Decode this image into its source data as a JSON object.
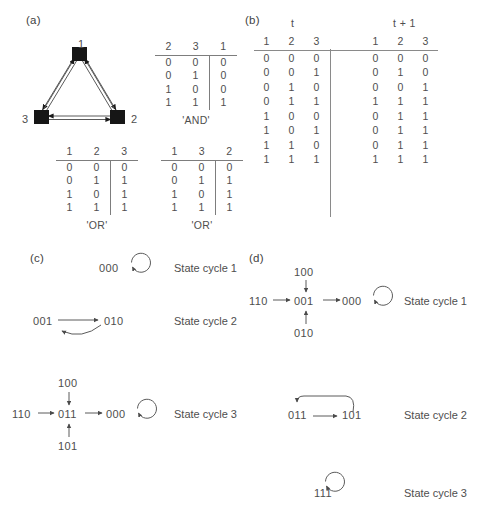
{
  "figure": {
    "panels": {
      "a": "(a)",
      "b": "(b)",
      "c": "(c)",
      "d": "(d)"
    }
  },
  "network": {
    "nodes": [
      {
        "id": "1",
        "label": "1"
      },
      {
        "id": "2",
        "label": "2"
      },
      {
        "id": "3",
        "label": "3"
      }
    ],
    "edges": [
      {
        "from": "1",
        "to": "3",
        "bidirectional": true
      },
      {
        "from": "1",
        "to": "2",
        "bidirectional": true
      },
      {
        "from": "3",
        "to": "2",
        "bidirectional": true
      }
    ]
  },
  "truth_tables": [
    {
      "id": "and-table",
      "headers": [
        "2",
        "3",
        "1"
      ],
      "rows": [
        [
          "0",
          "0",
          "0"
        ],
        [
          "0",
          "1",
          "0"
        ],
        [
          "1",
          "0",
          "0"
        ],
        [
          "1",
          "1",
          "1"
        ]
      ],
      "caption": "'AND'"
    },
    {
      "id": "or-table-1",
      "headers": [
        "1",
        "2",
        "3"
      ],
      "rows": [
        [
          "0",
          "0",
          "0"
        ],
        [
          "0",
          "1",
          "1"
        ],
        [
          "1",
          "0",
          "1"
        ],
        [
          "1",
          "1",
          "1"
        ]
      ],
      "caption": "'OR'"
    },
    {
      "id": "or-table-2",
      "headers": [
        "1",
        "3",
        "2"
      ],
      "rows": [
        [
          "0",
          "0",
          "0"
        ],
        [
          "0",
          "1",
          "1"
        ],
        [
          "1",
          "0",
          "1"
        ],
        [
          "1",
          "1",
          "1"
        ]
      ],
      "caption": "'OR'"
    }
  ],
  "transition_table": {
    "time_label_t": "t",
    "time_label_t1": "t + 1",
    "headers_t": [
      "1",
      "2",
      "3"
    ],
    "headers_t1": [
      "1",
      "2",
      "3"
    ],
    "rows": [
      {
        "t": [
          "0",
          "0",
          "0"
        ],
        "t1": [
          "0",
          "0",
          "0"
        ]
      },
      {
        "t": [
          "0",
          "0",
          "1"
        ],
        "t1": [
          "0",
          "1",
          "0"
        ]
      },
      {
        "t": [
          "0",
          "1",
          "0"
        ],
        "t1": [
          "0",
          "0",
          "1"
        ]
      },
      {
        "t": [
          "0",
          "1",
          "1"
        ],
        "t1": [
          "1",
          "1",
          "1"
        ]
      },
      {
        "t": [
          "1",
          "0",
          "0"
        ],
        "t1": [
          "0",
          "1",
          "1"
        ]
      },
      {
        "t": [
          "1",
          "0",
          "1"
        ],
        "t1": [
          "0",
          "1",
          "1"
        ]
      },
      {
        "t": [
          "1",
          "1",
          "0"
        ],
        "t1": [
          "0",
          "1",
          "1"
        ]
      },
      {
        "t": [
          "1",
          "1",
          "1"
        ],
        "t1": [
          "1",
          "1",
          "1"
        ]
      }
    ]
  },
  "panel_c": {
    "cycles": [
      {
        "label": "State cycle 1",
        "states": [
          "000"
        ],
        "self_loop_on": "000"
      },
      {
        "label": "State cycle 2",
        "states": [
          "001",
          "010"
        ],
        "transitions": [
          "001 -> 010",
          "010 -> 001"
        ]
      },
      {
        "label": "State cycle 3",
        "states": [
          "100",
          "110",
          "011",
          "000",
          "101"
        ],
        "transitions": [
          "100 -> 011",
          "110 -> 011",
          "101 -> 011",
          "011 -> 000",
          "000 -> 000"
        ],
        "self_loop_on": "000"
      }
    ]
  },
  "panel_d": {
    "cycles": [
      {
        "label": "State cycle 1",
        "states": [
          "100",
          "110",
          "001",
          "000",
          "010"
        ],
        "transitions": [
          "100 -> 001",
          "110 -> 001",
          "010 -> 001",
          "001 -> 000",
          "000 -> 000"
        ],
        "self_loop_on": "000"
      },
      {
        "label": "State cycle 2",
        "states": [
          "011",
          "101"
        ],
        "transitions": [
          "011 -> 101",
          "101 -> 011"
        ]
      },
      {
        "label": "State cycle 3",
        "states": [
          "111"
        ],
        "self_loop_on": "111"
      }
    ]
  }
}
